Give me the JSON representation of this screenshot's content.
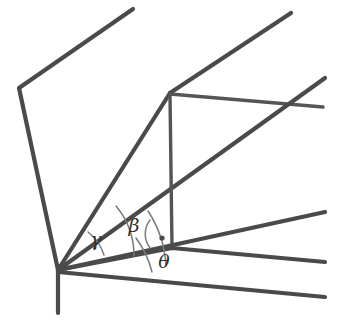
{
  "figure": {
    "background_color": "#ffffff",
    "line_color": "#4a4a4a",
    "arc_color": "#7a7a7a",
    "label_color": "#2f2f2f"
  },
  "labels": {
    "gamma": "γ",
    "beta": "β",
    "theta": "θ"
  },
  "geometry": {
    "apex": {
      "x": 58,
      "y": 270
    },
    "upper_vertex": {
      "x": 170,
      "y": 93
    },
    "foot_vertex": {
      "x": 172,
      "y": 248
    },
    "left_bend": {
      "x": 19,
      "y": 88
    },
    "top_tip": {
      "x": 133,
      "y": 9
    }
  },
  "label_positions": {
    "gamma": {
      "x": 96,
      "y": 241
    },
    "beta": {
      "x": 134,
      "y": 227
    },
    "theta": {
      "x": 164,
      "y": 263
    }
  },
  "right_angle_marker": {
    "x": 162,
    "y": 238,
    "radius": 2.6
  },
  "arcs": [
    {
      "name": "gamma-arc",
      "radius": 48
    },
    {
      "name": "beta-arc",
      "radius": 78
    },
    {
      "name": "theta-arc",
      "radius": 110
    }
  ],
  "strokes": {
    "main_width": 4.2,
    "thin_width": 3.4,
    "arc_width": 1.5
  }
}
